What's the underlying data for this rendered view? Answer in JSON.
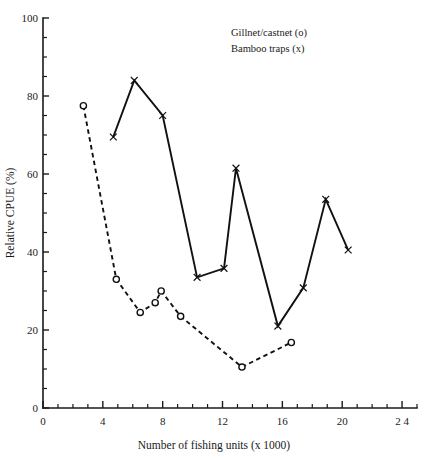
{
  "chart_data": {
    "type": "line",
    "title": "",
    "subtitle": "",
    "xlabel": "Number of fishing units (x 1000)",
    "ylabel": "Relative CPUE (%)",
    "xlim": [
      0,
      25
    ],
    "ylim": [
      0,
      100
    ],
    "grid": false,
    "legend_position": "top-right",
    "x_ticks": [
      0,
      4,
      8,
      12,
      16,
      20,
      24
    ],
    "x_tick_labels": [
      "0",
      "4",
      "8",
      "12",
      "16",
      "20",
      "2 4"
    ],
    "x_minor_step": 1,
    "y_ticks": [
      0,
      20,
      40,
      60,
      80,
      100
    ],
    "y_tick_labels": [
      "0",
      "20",
      "40",
      "60",
      "80",
      "100"
    ],
    "y_minor_step": 5,
    "series": [
      {
        "name": "Gillnet/castnet (o)",
        "marker": "circle",
        "linestyle": "dashed",
        "points": [
          {
            "x": 2.7,
            "y": 77.5
          },
          {
            "x": 4.9,
            "y": 33.0
          },
          {
            "x": 6.5,
            "y": 24.5
          },
          {
            "x": 7.5,
            "y": 27.0
          },
          {
            "x": 7.9,
            "y": 30.0
          },
          {
            "x": 9.2,
            "y": 23.5
          },
          {
            "x": 13.3,
            "y": 10.5
          },
          {
            "x": 16.6,
            "y": 16.8
          }
        ]
      },
      {
        "name": "Bamboo traps (x)",
        "marker": "cross",
        "linestyle": "solid",
        "points": [
          {
            "x": 4.7,
            "y": 69.5
          },
          {
            "x": 6.1,
            "y": 84.0
          },
          {
            "x": 8.0,
            "y": 75.0
          },
          {
            "x": 10.3,
            "y": 33.5
          },
          {
            "x": 12.1,
            "y": 35.8
          },
          {
            "x": 12.9,
            "y": 61.5
          },
          {
            "x": 15.7,
            "y": 21.0
          },
          {
            "x": 17.4,
            "y": 30.8
          },
          {
            "x": 18.9,
            "y": 53.5
          },
          {
            "x": 20.4,
            "y": 40.5
          }
        ]
      }
    ]
  },
  "legend": {
    "entries": [
      {
        "label": "Gillnet/castnet (o)"
      },
      {
        "label": "Bamboo traps (x)"
      }
    ]
  },
  "axes": {
    "y_title": "Relative CPUE (%)",
    "x_title": "Number of fishing units (x 1000)"
  },
  "colors": {
    "ink": "#111111",
    "background": "#ffffff"
  }
}
